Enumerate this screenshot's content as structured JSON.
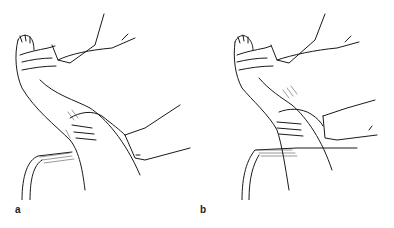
{
  "figure": {
    "panels": [
      {
        "id": "a",
        "label": "a",
        "description": "Line drawing: examiner's hands holding a raised leg at the foot and grasping the calf, leg resting over a cylindrical bolster"
      },
      {
        "id": "b",
        "label": "b",
        "description": "Line drawing: examiner's hands holding a raised leg at the foot and grasping the lower thigh/knee region, leg resting over a cylindrical bolster"
      }
    ]
  }
}
